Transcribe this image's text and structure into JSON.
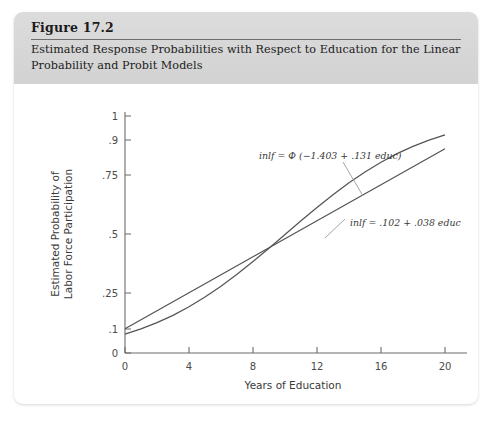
{
  "figure": {
    "number": "Figure 17.2",
    "caption": "Estimated Response Probabilities with Respect to Education for the Linear Probability and Probit Models"
  },
  "chart_data": {
    "type": "line",
    "title": "Estimated Response Probabilities with Respect to Education for the Linear Probability and Probit Models",
    "xlabel": "Years of Education",
    "ylabel": "Estimated Probability of Labor Force Participation",
    "xlim": [
      0,
      20
    ],
    "ylim": [
      0,
      1
    ],
    "grid": false,
    "legend_position": "inline-annotations",
    "xticks": [
      0,
      4,
      8,
      12,
      16,
      20
    ],
    "xtick_labels": [
      "0",
      "4",
      "8",
      "12",
      "16",
      "20"
    ],
    "yticks": [
      0,
      0.1,
      0.25,
      0.5,
      0.75,
      0.9,
      1
    ],
    "ytick_labels": [
      "0",
      ".1",
      ".25",
      ".5",
      ".75",
      ".9",
      "1"
    ],
    "series": [
      {
        "name": "probit",
        "label": "inlf = Φ (−1.403 + .131 educ)",
        "color": "#555555",
        "x": [
          0,
          1,
          2,
          3,
          4,
          5,
          6,
          7,
          8,
          9,
          10,
          11,
          12,
          13,
          14,
          15,
          16,
          17,
          18,
          19,
          20
        ],
        "y": [
          0.08,
          0.102,
          0.128,
          0.159,
          0.195,
          0.236,
          0.282,
          0.332,
          0.386,
          0.442,
          0.5,
          0.558,
          0.614,
          0.668,
          0.718,
          0.764,
          0.805,
          0.841,
          0.872,
          0.898,
          0.92
        ]
      },
      {
        "name": "linear-probability",
        "label": "inlf = .102 + .038 educ",
        "color": "#555555",
        "x": [
          0,
          4,
          8,
          12,
          16,
          20
        ],
        "y": [
          0.102,
          0.254,
          0.406,
          0.558,
          0.71,
          0.862
        ]
      }
    ],
    "annotations": [
      {
        "name": "probit-equation",
        "text": "inlf = Φ (−1.403 + .131 educ)",
        "x_px": 234,
        "y_px": 69
      },
      {
        "name": "linear-equation",
        "text": "inlf = .102 + .038 educ",
        "x_px": 325,
        "y_px": 136
      }
    ]
  },
  "axes": {
    "x_title": "Years of Education",
    "y_title_line1": "Estimated Probability of",
    "y_title_line2": "Labor Force Participation",
    "xtick_0": "0",
    "xtick_4": "4",
    "xtick_8": "8",
    "xtick_12": "12",
    "xtick_16": "16",
    "xtick_20": "20",
    "ytick_0": "0",
    "ytick_01": ".1",
    "ytick_025": ".25",
    "ytick_05": ".5",
    "ytick_075": ".75",
    "ytick_09": ".9",
    "ytick_1": "1"
  },
  "equations": {
    "probit": "inlf = Φ (−1.403 + .131 educ)",
    "linear": "inlf = .102 + .038 educ"
  },
  "colors": {
    "header_band": "#d6d6d6",
    "card_background": "#ffffff",
    "axis_line": "#6b6b6b",
    "curve": "#555555",
    "text": "#1b1b1b"
  }
}
